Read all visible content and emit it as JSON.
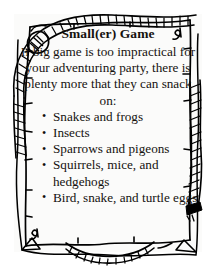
{
  "card": {
    "title": "Small(er) Game",
    "intro": "If big game is too impractical for your adventuring party, there is plenty more that they can snack on:",
    "list": [
      "Snakes and frogs",
      "Insects",
      "Sparrows and pigeons",
      "Squirrels, mice, and hedgehogs",
      "Bird, snake, and turtle eggs"
    ],
    "bullet_glyph": "•"
  },
  "decoration": {
    "border_style": "hand-drawn rope frame",
    "corner_knot_top_left": "rope-loop-knot",
    "corner_flourish_top_right": "ink-curl",
    "corner_flourish_bottom_left": "ink-curl",
    "rope_end_right": "frayed-rope-tip",
    "rope_swag_bottom": "hanging-rope-arc"
  },
  "colors": {
    "ink": "#000000",
    "text": "#15120f",
    "paper": "#fbfbfa",
    "page": "#ffffff"
  }
}
